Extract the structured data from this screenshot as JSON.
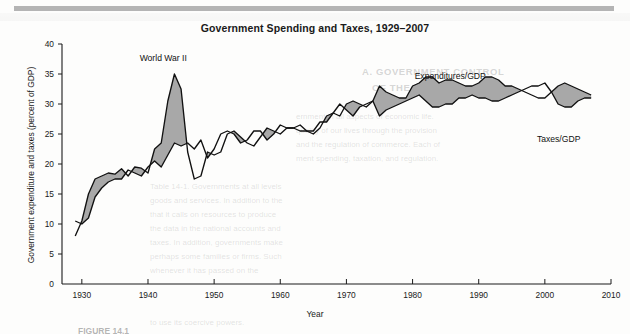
{
  "chart_data": {
    "type": "area",
    "title": "Government Spending and Taxes, 1929–2007",
    "xlabel": "Year",
    "ylabel": "Government expenditure and taxes (percent of GDP)",
    "xlim": [
      1927,
      2010
    ],
    "ylim": [
      0,
      40
    ],
    "xticks": [
      1930,
      1940,
      1950,
      1960,
      1970,
      1980,
      1990,
      2000,
      2010
    ],
    "yticks": [
      0,
      5,
      10,
      15,
      20,
      25,
      30,
      35,
      40
    ],
    "grid": false,
    "legend_position": "inline-annotations",
    "shaded_region_label": "Gap between expenditures and taxes (deficit shaded gray)",
    "shade_color": "#a8a8a8",
    "line_color": "#111111",
    "annotations": [
      {
        "text": "World War II",
        "year": 1943,
        "value": 37.5
      },
      {
        "text": "Expenditures/GDP",
        "year": 1986,
        "value": 34.5
      },
      {
        "text": "Taxes/GDP",
        "year": 2002,
        "value": 24.0
      }
    ],
    "x": [
      1929,
      1930,
      1931,
      1932,
      1933,
      1934,
      1935,
      1936,
      1937,
      1938,
      1939,
      1940,
      1941,
      1942,
      1943,
      1944,
      1945,
      1946,
      1947,
      1948,
      1949,
      1950,
      1951,
      1952,
      1953,
      1954,
      1955,
      1956,
      1957,
      1958,
      1959,
      1960,
      1961,
      1962,
      1963,
      1964,
      1965,
      1966,
      1967,
      1968,
      1969,
      1970,
      1971,
      1972,
      1973,
      1974,
      1975,
      1976,
      1977,
      1978,
      1979,
      1980,
      1981,
      1982,
      1983,
      1984,
      1985,
      1986,
      1987,
      1988,
      1989,
      1990,
      1991,
      1992,
      1993,
      1994,
      1995,
      1996,
      1997,
      1998,
      1999,
      2000,
      2001,
      2002,
      2003,
      2004,
      2005,
      2006,
      2007
    ],
    "series": [
      {
        "name": "Expenditures/GDP",
        "values": [
          8.0,
          10.5,
          15.0,
          17.5,
          18.0,
          18.5,
          18.3,
          19.2,
          18.0,
          19.5,
          19.3,
          18.5,
          22.5,
          23.5,
          30.5,
          35.0,
          32.5,
          22.0,
          17.5,
          18.0,
          22.0,
          21.5,
          22.0,
          25.0,
          25.5,
          24.5,
          23.5,
          23.0,
          24.5,
          26.0,
          25.5,
          25.0,
          26.0,
          26.0,
          25.5,
          25.5,
          25.0,
          26.0,
          28.0,
          28.5,
          28.0,
          30.0,
          30.5,
          30.0,
          29.5,
          30.5,
          33.0,
          32.0,
          31.5,
          31.0,
          31.0,
          33.0,
          33.5,
          34.5,
          34.5,
          33.5,
          34.0,
          34.0,
          33.5,
          33.0,
          33.0,
          33.5,
          34.5,
          34.5,
          34.0,
          33.0,
          33.0,
          32.5,
          32.0,
          31.5,
          31.0,
          31.0,
          32.0,
          33.0,
          33.5,
          33.0,
          32.5,
          32.0,
          31.5
        ]
      },
      {
        "name": "Taxes/GDP",
        "values": [
          10.5,
          10.0,
          11.0,
          14.5,
          16.0,
          17.0,
          17.5,
          17.5,
          19.0,
          18.5,
          18.0,
          19.5,
          20.5,
          19.5,
          21.5,
          23.5,
          23.0,
          23.5,
          22.5,
          24.0,
          21.0,
          22.5,
          25.0,
          25.5,
          25.0,
          23.5,
          24.0,
          25.5,
          25.5,
          24.0,
          25.0,
          26.5,
          26.0,
          26.0,
          26.5,
          25.5,
          25.5,
          27.0,
          27.0,
          28.5,
          30.0,
          29.0,
          28.0,
          29.5,
          30.0,
          30.5,
          28.0,
          29.0,
          29.5,
          30.0,
          30.5,
          31.0,
          31.5,
          30.5,
          29.5,
          29.5,
          30.0,
          30.0,
          31.0,
          31.0,
          31.5,
          31.0,
          31.0,
          30.5,
          30.5,
          31.0,
          31.5,
          32.0,
          32.5,
          33.0,
          33.0,
          33.5,
          32.0,
          30.0,
          29.5,
          29.5,
          30.5,
          31.0,
          31.0
        ]
      }
    ]
  },
  "figure": {
    "caption_partial": "FIGURE 14.1"
  },
  "page_ghost_text": {
    "heading_1": "A. GOVERNMENT CONTROL",
    "heading_2": "OF THE ECONOMY",
    "lines": [
      "ernment in all aspects of economic life.",
      "quality of our lives through the provision",
      "and the regulation of commerce. Each of",
      "ment spending, taxation, and regulation.",
      "Table 14-1. Governments at all levels",
      "goods and services. In addition to the",
      "that it calls on resources to produce",
      "the data in the national accounts and",
      "taxes. In addition, governments make",
      "perhaps some families or firms. Such",
      "whenever it has passed on the",
      "to use its coercive powers."
    ]
  }
}
